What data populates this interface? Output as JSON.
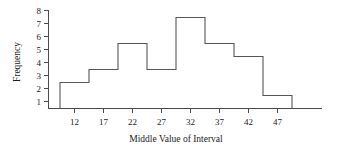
{
  "chart_data": {
    "type": "bar",
    "title": "",
    "subtitle": "",
    "xlabel": "Middle Value of Interval",
    "ylabel": "Frequency",
    "categories": [
      12,
      17,
      22,
      27,
      32,
      37,
      42,
      47
    ],
    "values": [
      2,
      3,
      5,
      3,
      7,
      5,
      4,
      1
    ],
    "bin_width": 5,
    "bin_edges": [
      9.5,
      14.5,
      19.5,
      24.5,
      29.5,
      34.5,
      39.5,
      44.5,
      49.5
    ],
    "xtick_labels": [
      "12",
      "17",
      "22",
      "27",
      "32",
      "37",
      "42",
      "47"
    ],
    "ytick_labels": [
      "1",
      "2",
      "3",
      "4",
      "5",
      "6",
      "7",
      "8"
    ],
    "ylim": [
      0,
      8
    ],
    "xlim": [
      7,
      57
    ],
    "grid": false,
    "legend": null,
    "legend_position": "none",
    "annotations": [],
    "style": {
      "outline_color": "#555555",
      "axis_color": "#4a4a4a",
      "text_color": "#1a1a1a",
      "background": "#ffffff",
      "filled_bars": false
    }
  }
}
